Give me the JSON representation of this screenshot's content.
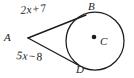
{
  "figure": {
    "type": "geometry-diagram",
    "background_color": "#ffffff",
    "stroke_color": "#1c1c1c",
    "points": {
      "A": {
        "label": "A",
        "x": 28,
        "y": 38
      },
      "B": {
        "label": "B",
        "x": 85,
        "y": 15
      },
      "C": {
        "label": "C",
        "x": 94,
        "y": 37
      },
      "D": {
        "label": "D",
        "x": 77,
        "y": 66
      }
    },
    "circle": {
      "center_x": 95,
      "center_y": 41,
      "radius": 29,
      "center_dot_radius": 2.2
    },
    "segments": [
      {
        "name": "AB",
        "label": "2x + 7",
        "label_parts": {
          "term": "2x",
          "operator": "+",
          "constant": "7"
        }
      },
      {
        "name": "AD",
        "label": "5x − 8",
        "label_parts": {
          "term": "5x",
          "operator": "−",
          "constant": "8"
        }
      }
    ],
    "labels": {
      "point_a": "A",
      "point_b": "B",
      "point_c": "C",
      "point_d": "D",
      "segment_ab_term": "2x",
      "segment_ab_operator": "+",
      "segment_ab_constant": "7",
      "segment_ad_term": "5x",
      "segment_ad_operator": "−",
      "segment_ad_constant": "8"
    }
  }
}
